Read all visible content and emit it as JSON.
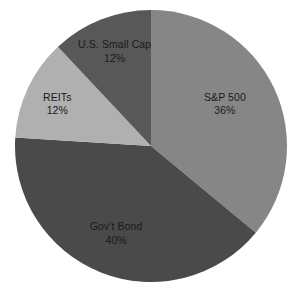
{
  "chart_data": {
    "type": "pie",
    "title": "",
    "subtitle": "",
    "xlabel": "",
    "ylabel": "",
    "legend_position": "none",
    "grid": false,
    "background_color": "#ffffff",
    "label_color": "#1a1a1a",
    "start_angle_deg": 0,
    "direction": "clockwise",
    "units": "percent",
    "categories": [
      "S&P 500",
      "Gov't Bond",
      "REITs",
      "U.S. Small Cap"
    ],
    "values": [
      36,
      40,
      12,
      12
    ],
    "slices": [
      {
        "name": "S&P 500",
        "value": 36,
        "value_label": "36%",
        "color": "#868686",
        "start_deg": 0,
        "end_deg": 129.6,
        "label_x_pct": 76.5,
        "label_y_pct": 34.5
      },
      {
        "name": "Gov't Bond",
        "value": 40,
        "value_label": "40%",
        "color": "#4a4a4a",
        "start_deg": 129.6,
        "end_deg": 273.6,
        "label_x_pct": 39.5,
        "label_y_pct": 77.5
      },
      {
        "name": "REITs",
        "value": 12,
        "value_label": "12%",
        "color": "#b0b0b0",
        "start_deg": 273.6,
        "end_deg": 316.8,
        "label_x_pct": 19.5,
        "label_y_pct": 34.5
      },
      {
        "name": "U.S. Small Cap",
        "value": 12,
        "value_label": "12%",
        "color": "#585858",
        "start_deg": 316.8,
        "end_deg": 360,
        "label_x_pct": 39.0,
        "label_y_pct": 17.0
      }
    ],
    "geometry": {
      "center_x": 151,
      "center_y": 146,
      "radius": 136
    }
  }
}
